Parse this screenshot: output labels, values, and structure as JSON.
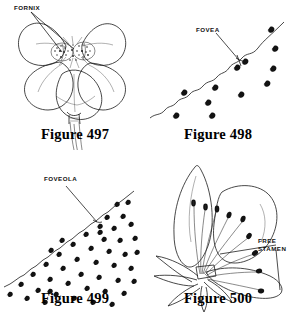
{
  "plate": {
    "width": 288,
    "height": 324,
    "background_color": "#ffffff",
    "ink_color": "#1b1b1b",
    "figure_count": 4
  },
  "figures": [
    {
      "id": "497",
      "caption": "Figure 497",
      "subject": "flower-face-view",
      "description": "Five-petalled flower viewed face-on with stippled fornix structures at the corolla throat and a slender tapering stem below",
      "callouts": [
        {
          "label": "FORNIX",
          "target": "corolla-throat-scales"
        }
      ]
    },
    {
      "id": "498",
      "caption": "Figure 498",
      "subject": "fovea-surface-sparse",
      "description": "Wavy diagonal margin line with a sparse scattered field of small comma-shaped marks below and right of the line",
      "callouts": [
        {
          "label": "FOVEA",
          "target": "pit-on-margin"
        }
      ],
      "mark_count": 11
    },
    {
      "id": "499",
      "caption": "Figure 499",
      "subject": "foveola-surface-dense",
      "description": "Straighter diagonal margin line with a dense scattered field of small comma-shaped marks filling the lower right region",
      "callouts": [
        {
          "label": "FOVEOLA",
          "target": "small-pit-on-margin"
        }
      ],
      "mark_count": 46
    },
    {
      "id": "500",
      "caption": "Figure 500",
      "subject": "flower-with-free-stamens",
      "description": "Side view of a flower with two large petals and narrow sepals, showing a radiating fan of long filaments each tipped with an anther, arising separately from the receptacle",
      "callouts": [
        {
          "label": "FREE",
          "label_line_2": "STAMEN",
          "target": "separate-stamen-filament"
        }
      ],
      "stamen_count": 9
    }
  ],
  "labels": {
    "fornix": "FORNIX",
    "fovea": "FOVEA",
    "foveola": "FOVEOLA",
    "free": "FREE",
    "stamen": "STAMEN"
  },
  "captions": {
    "fig497": "Figure 497",
    "fig498": "Figure 498",
    "fig499": "Figure 499",
    "fig500": "Figure 500"
  }
}
